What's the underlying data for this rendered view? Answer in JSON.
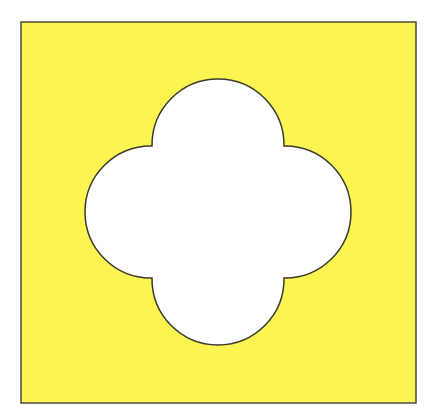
{
  "figure": {
    "background_color": "#ffffff",
    "square": {
      "x": 21,
      "y": 22,
      "width": 395,
      "height": 381,
      "fill": "#fcf551",
      "stroke": "#4a4a3a"
    },
    "quatrefoil": {
      "center": [
        218,
        212
      ],
      "lobe_offset": 65,
      "lobe_radius": 66,
      "fill": "#ffffff",
      "stroke": "#3a3a30"
    }
  }
}
